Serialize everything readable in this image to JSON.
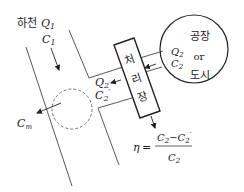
{
  "river": {
    "label": "하천",
    "flow": "Q",
    "flow_sub": "1",
    "conc": "C",
    "conc_sub": "1"
  },
  "mixing": {
    "conc": "C",
    "conc_sub": "m"
  },
  "treatment_plant": {
    "chars": [
      "처",
      "리",
      "장"
    ]
  },
  "effluent": {
    "flow": "Q",
    "flow_sub": "2",
    "conc": "C",
    "conc_sub": "2",
    "prime": "′"
  },
  "source": {
    "line1": "공장",
    "line2": "or",
    "line3": "도시",
    "flow": "Q",
    "flow_sub": "2",
    "conc": "C",
    "conc_sub": "2"
  },
  "formula": {
    "lhs": "η",
    "equals": "=",
    "num_a": "C",
    "num_a_sub": "2",
    "minus": "−",
    "num_b": "C",
    "num_b_sub": "2",
    "num_b_prime": "′",
    "den": "C",
    "den_sub": "2"
  }
}
